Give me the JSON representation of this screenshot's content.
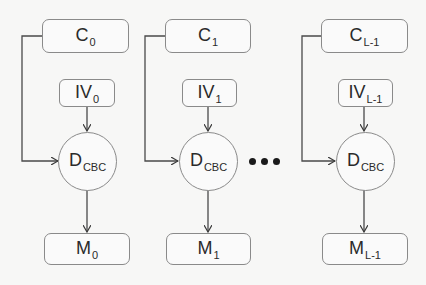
{
  "diagram": {
    "columns": [
      {
        "ciphertext": {
          "base": "C",
          "sub": "0"
        },
        "iv": {
          "base": "IV",
          "sub": "0"
        },
        "decrypt": {
          "base": "D",
          "sub": "CBC"
        },
        "message": {
          "base": "M",
          "sub": "0"
        }
      },
      {
        "ciphertext": {
          "base": "C",
          "sub": "1"
        },
        "iv": {
          "base": "IV",
          "sub": "1"
        },
        "decrypt": {
          "base": "D",
          "sub": "CBC"
        },
        "message": {
          "base": "M",
          "sub": "1"
        }
      },
      {
        "ciphertext": {
          "base": "C",
          "sub": "L-1"
        },
        "iv": {
          "base": "IV",
          "sub": "L-1"
        },
        "decrypt": {
          "base": "D",
          "sub": "CBC"
        },
        "message": {
          "base": "M",
          "sub": "L-1"
        }
      }
    ],
    "ellipsis": "•••",
    "colors": {
      "stroke": "#8a8a8a",
      "arrow": "#3a3a3a",
      "text": "#2a2a2a",
      "background": "#f7f7f6"
    }
  }
}
